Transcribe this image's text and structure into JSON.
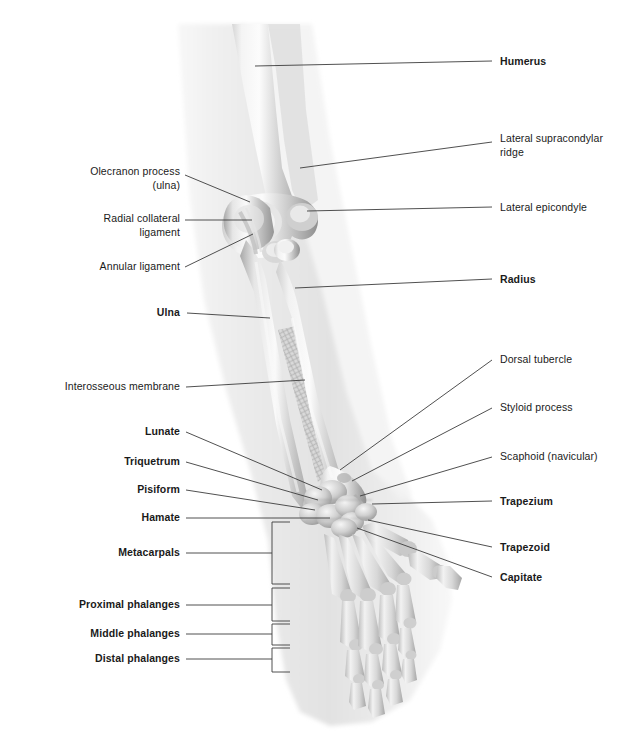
{
  "figure": {
    "background_color": "#ffffff",
    "label_color": "#1a1a1a",
    "leader_line_color": "#3c3c3c",
    "bone_light": "#e8e8e8",
    "bone_mid": "#b8b8b8",
    "bone_dark": "#8f8f8f",
    "soft_tissue": "#f0f0f0"
  },
  "labels_right": [
    {
      "id": "humerus",
      "text": "Humerus",
      "bold": true,
      "x": 500,
      "y": 55,
      "leader": [
        [
          255,
          66
        ],
        [
          492,
          61
        ]
      ]
    },
    {
      "id": "lateral-supracondylar-ridge",
      "text": "Lateral supracondylar\nridge",
      "bold": false,
      "x": 500,
      "y": 132,
      "leader": [
        [
          300,
          168
        ],
        [
          492,
          142
        ]
      ]
    },
    {
      "id": "lateral-epicondyle",
      "text": "Lateral epicondyle",
      "bold": false,
      "x": 500,
      "y": 201,
      "leader": [
        [
          307,
          211
        ],
        [
          492,
          207
        ]
      ]
    },
    {
      "id": "radius",
      "text": "Radius",
      "bold": true,
      "x": 500,
      "y": 273,
      "leader": [
        [
          295,
          288
        ],
        [
          492,
          279
        ]
      ]
    },
    {
      "id": "dorsal-tubercle",
      "text": "Dorsal tubercle",
      "bold": false,
      "x": 500,
      "y": 353,
      "leader": [
        [
          340,
          470
        ],
        [
          492,
          360
        ]
      ]
    },
    {
      "id": "styloid-process",
      "text": "Styloid process",
      "bold": false,
      "x": 500,
      "y": 401,
      "leader": [
        [
          352,
          481
        ],
        [
          492,
          408
        ]
      ]
    },
    {
      "id": "scaphoid-navicular",
      "text": "Scaphoid (navicular)",
      "bold": false,
      "x": 500,
      "y": 450,
      "leader": [
        [
          360,
          496
        ],
        [
          492,
          457
        ]
      ]
    },
    {
      "id": "trapezium",
      "text": "Trapezium",
      "bold": true,
      "x": 500,
      "y": 495,
      "leader": [
        [
          372,
          504
        ],
        [
          492,
          501
        ]
      ]
    },
    {
      "id": "trapezoid",
      "text": "Trapezoid",
      "bold": true,
      "x": 500,
      "y": 541,
      "leader": [
        [
          368,
          520
        ],
        [
          492,
          547
        ]
      ]
    },
    {
      "id": "capitate",
      "text": "Capitate",
      "bold": true,
      "x": 500,
      "y": 571,
      "leader": [
        [
          357,
          528
        ],
        [
          492,
          577
        ]
      ]
    }
  ],
  "labels_left": [
    {
      "id": "olecranon-process-ulna",
      "text": "Olecranon process\n(ulna)",
      "bold": false,
      "x": 60,
      "y": 165,
      "width": 120,
      "leader": [
        [
          250,
          202
        ],
        [
          185,
          175
        ]
      ]
    },
    {
      "id": "radial-collateral-ligament",
      "text": "Radial collateral\nligament",
      "bold": false,
      "x": 68,
      "y": 212,
      "width": 112,
      "leader": [
        [
          252,
          220
        ],
        [
          185,
          220
        ]
      ]
    },
    {
      "id": "annular-ligament",
      "text": "Annular ligament",
      "bold": false,
      "x": 60,
      "y": 260,
      "width": 120,
      "leader": [
        [
          253,
          234
        ],
        [
          185,
          267
        ]
      ]
    },
    {
      "id": "ulna",
      "text": "Ulna",
      "bold": true,
      "x": 120,
      "y": 306,
      "width": 60,
      "leader": [
        [
          270,
          318
        ],
        [
          187,
          313
        ]
      ]
    },
    {
      "id": "interosseous-membrane",
      "text": "Interosseous membrane",
      "bold": false,
      "x": 30,
      "y": 380,
      "width": 150,
      "leader": [
        [
          305,
          380
        ],
        [
          186,
          387
        ]
      ]
    },
    {
      "id": "lunate",
      "text": "Lunate",
      "bold": true,
      "x": 112,
      "y": 425,
      "width": 68,
      "leader": [
        [
          322,
          490
        ],
        [
          186,
          432
        ]
      ]
    },
    {
      "id": "triquetrum",
      "text": "Triquetrum",
      "bold": true,
      "x": 88,
      "y": 455,
      "width": 92,
      "leader": [
        [
          318,
          500
        ],
        [
          186,
          462
        ]
      ]
    },
    {
      "id": "pisiform",
      "text": "Pisiform",
      "bold": true,
      "x": 103,
      "y": 483,
      "width": 77,
      "leader": [
        [
          315,
          510
        ],
        [
          186,
          490
        ]
      ]
    },
    {
      "id": "hamate",
      "text": "Hamate",
      "bold": true,
      "x": 106,
      "y": 511,
      "width": 74,
      "leader": [
        [
          330,
          518
        ],
        [
          186,
          518
        ]
      ]
    },
    {
      "id": "metacarpals",
      "text": "Metacarpals",
      "bold": true,
      "x": 85,
      "y": 546,
      "width": 95,
      "leader": [
        [
          270,
          553
        ],
        [
          186,
          553
        ]
      ]
    },
    {
      "id": "proximal-phalanges",
      "text": "Proximal phalanges",
      "bold": true,
      "x": 45,
      "y": 598,
      "width": 135,
      "leader": [
        [
          270,
          605
        ],
        [
          186,
          605
        ]
      ]
    },
    {
      "id": "middle-phalanges",
      "text": "Middle phalanges",
      "bold": true,
      "x": 55,
      "y": 627,
      "width": 125,
      "leader": [
        [
          270,
          634
        ],
        [
          186,
          634
        ]
      ]
    },
    {
      "id": "distal-phalanges",
      "text": "Distal phalanges",
      "bold": true,
      "x": 62,
      "y": 652,
      "width": 118,
      "leader": [
        [
          270,
          659
        ],
        [
          186,
          659
        ]
      ]
    }
  ],
  "brackets": [
    {
      "id": "bracket-metacarpals",
      "x": 272,
      "y_top": 522,
      "y_bottom": 584,
      "tip_x": 290
    },
    {
      "id": "bracket-proximal-phalanges",
      "x": 272,
      "y_top": 588,
      "y_bottom": 621,
      "tip_x": 290
    },
    {
      "id": "bracket-middle-phalanges",
      "x": 272,
      "y_top": 624,
      "y_bottom": 645,
      "tip_x": 290
    },
    {
      "id": "bracket-distal-phalanges",
      "x": 272,
      "y_top": 648,
      "y_bottom": 672,
      "tip_x": 290
    }
  ]
}
